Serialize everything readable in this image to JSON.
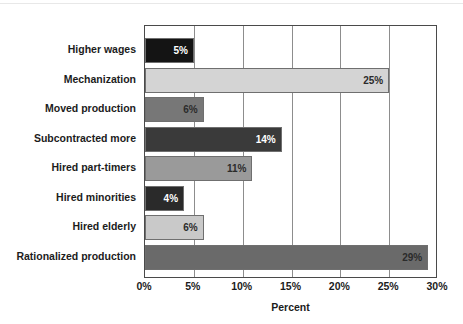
{
  "chart_data": {
    "type": "bar",
    "orientation": "horizontal",
    "title": "",
    "xlabel": "Percent",
    "ylabel": "",
    "xlim": [
      0,
      30
    ],
    "xticks": [
      "0%",
      "5%",
      "10%",
      "15%",
      "20%",
      "25%",
      "30%"
    ],
    "xtick_values": [
      0,
      5,
      10,
      15,
      20,
      25,
      30
    ],
    "grid": "vertical",
    "legend": "none",
    "categories": [
      "Higher wages",
      "Mechanization",
      "Moved production",
      "Subcontracted more",
      "Hired part-timers",
      "Hired minorities",
      "Hired elderly",
      "Rationalized production"
    ],
    "values": [
      5,
      25,
      6,
      14,
      11,
      4,
      6,
      29
    ],
    "value_labels": [
      "5%",
      "25%",
      "6%",
      "14%",
      "11%",
      "4%",
      "6%",
      "29%"
    ],
    "bar_colors": [
      "#141414",
      "#d4d4d4",
      "#777777",
      "#3a3a3a",
      "#9a9a9a",
      "#2a2a2a",
      "#c9c9c9",
      "#6a6a6a"
    ],
    "label_text_colors": [
      "#ffffff",
      "#2b2b2b",
      "#2b2b2b",
      "#ffffff",
      "#2b2b2b",
      "#ffffff",
      "#2b2b2b",
      "#2b2b2b"
    ],
    "frame_color": "#4a4a4a",
    "gridline_color": "#8d8d8d",
    "bar_border_color": "#6f6f6f",
    "background": "#ffffff"
  }
}
